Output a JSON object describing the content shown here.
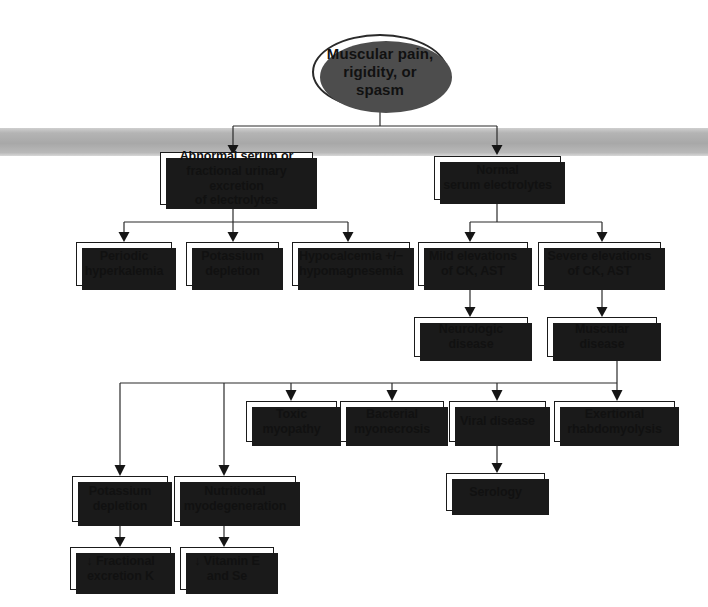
{
  "diagram": {
    "type": "clinical-decision-flowchart",
    "root": {
      "id": "root",
      "label": "Muscular pain,\nrigidity, or\nspasm",
      "shape": "oval"
    },
    "nodes": [
      {
        "id": "abnormal-electrolytes",
        "label": "Abnormal serum or\nfractional urinary excretion\nof electrolytes",
        "shape": "box"
      },
      {
        "id": "normal-electrolytes",
        "label": "Normal\nserum electrolytes",
        "shape": "box"
      },
      {
        "id": "periodic-hyperkalemia",
        "label": "Periodic\nhyperkalemia",
        "shape": "box"
      },
      {
        "id": "potassium-depletion-1",
        "label": "Potassium\ndepletion",
        "shape": "box"
      },
      {
        "id": "hypocalcemia",
        "label": "Hypocalcemia +/−\nhypomagnesemia",
        "shape": "box"
      },
      {
        "id": "mild-elevations",
        "label": "Mild elevations\nof CK, AST",
        "shape": "box"
      },
      {
        "id": "severe-elevations",
        "label": "Severe elevations\nof CK, AST",
        "shape": "box"
      },
      {
        "id": "neurologic-disease",
        "label": "Neurologic disease",
        "shape": "box"
      },
      {
        "id": "muscular-disease",
        "label": "Muscular disease",
        "shape": "box"
      },
      {
        "id": "toxic-myopathy",
        "label": "Toxic\nmyopathy",
        "shape": "box"
      },
      {
        "id": "bacterial-myonecrosis",
        "label": "Bacterial\nmyonecrosis",
        "shape": "box"
      },
      {
        "id": "viral-disease",
        "label": "Viral disease",
        "shape": "box"
      },
      {
        "id": "exertional-rhabdomyolysis",
        "label": "Exertional\nrhabdomyolysis",
        "shape": "box"
      },
      {
        "id": "potassium-depletion-2",
        "label": "Potassium\ndepletion",
        "shape": "box"
      },
      {
        "id": "nutritional-myodegeneration",
        "label": "Nutritional\nmyodegeneration",
        "shape": "box"
      },
      {
        "id": "fractional-excretion-k",
        "label": "↓ Fractional\nexcretion K",
        "shape": "box"
      },
      {
        "id": "vitamin-e-se",
        "label": "↓ Vitamin E\nand Se",
        "shape": "box"
      },
      {
        "id": "serology",
        "label": "Serology",
        "shape": "box"
      }
    ],
    "edges": [
      {
        "from": "root",
        "to": "abnormal-electrolytes"
      },
      {
        "from": "root",
        "to": "normal-electrolytes"
      },
      {
        "from": "abnormal-electrolytes",
        "to": "periodic-hyperkalemia"
      },
      {
        "from": "abnormal-electrolytes",
        "to": "potassium-depletion-1"
      },
      {
        "from": "abnormal-electrolytes",
        "to": "hypocalcemia"
      },
      {
        "from": "normal-electrolytes",
        "to": "mild-elevations"
      },
      {
        "from": "normal-electrolytes",
        "to": "severe-elevations"
      },
      {
        "from": "mild-elevations",
        "to": "neurologic-disease"
      },
      {
        "from": "severe-elevations",
        "to": "muscular-disease"
      },
      {
        "from": "muscular-disease",
        "to": "potassium-depletion-2"
      },
      {
        "from": "muscular-disease",
        "to": "nutritional-myodegeneration"
      },
      {
        "from": "muscular-disease",
        "to": "toxic-myopathy"
      },
      {
        "from": "muscular-disease",
        "to": "bacterial-myonecrosis"
      },
      {
        "from": "muscular-disease",
        "to": "viral-disease"
      },
      {
        "from": "muscular-disease",
        "to": "exertional-rhabdomyolysis"
      },
      {
        "from": "potassium-depletion-2",
        "to": "fractional-excretion-k"
      },
      {
        "from": "nutritional-myodegeneration",
        "to": "vitamin-e-se"
      },
      {
        "from": "viral-disease",
        "to": "serology"
      }
    ],
    "colors": {
      "background": "#ffffff",
      "box_fill": "#ffffff",
      "box_border": "#1a1a1a",
      "box_shadow": "#1a1a1a",
      "connector": "#2b2b2b",
      "text": "#111111",
      "scan_band": "#b0b0b0"
    }
  }
}
